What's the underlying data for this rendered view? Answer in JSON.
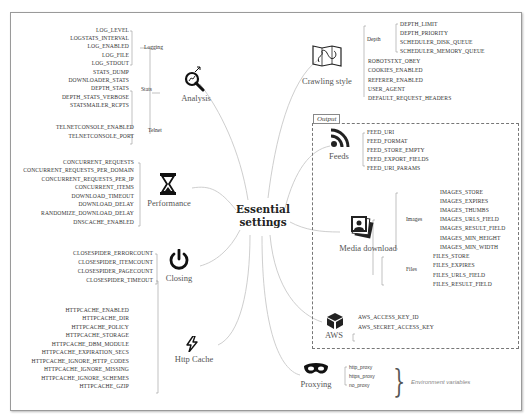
{
  "center": {
    "line1": "Essential",
    "line2": "settings"
  },
  "output_label": "Output",
  "env_label": "Environment variables",
  "analysis": {
    "label": "Analysis",
    "icon": "magnifier-chart-icon",
    "logging": {
      "label": "Logging",
      "items": [
        "LOG_LEVEL",
        "LOGSTATS_INTERVAL",
        "LOG_ENABLED",
        "LOG_FILE",
        "LOG_STDOUT"
      ]
    },
    "stats": {
      "label": "Stats",
      "items": [
        "STATS_DUMP",
        "DOWNLOADER_STATS",
        "DEPTH_STATS",
        "DEPTH_STATS_VERBOSE",
        "STATSMAILER_RCPTS"
      ]
    },
    "telnet": {
      "label": "Telnet",
      "items": [
        "TELNETCONSOLE_ENABLED",
        "TELNETCONSOLE_PORT"
      ]
    }
  },
  "performance": {
    "label": "Performance",
    "icon": "hourglass-icon",
    "items": [
      "CONCURRENT_REQUESTS",
      "CONCURRENT_REQUESTS_PER_DOMAIN",
      "CONCURRENT_REQUESTS_PER_IP",
      "CONCURRENT_ITEMS",
      "DOWNLOAD_TIMEOUT",
      "DOWNLOAD_DELAY",
      "RANDOMIZE_DOWNLOAD_DELAY",
      "DNSCACHE_ENABLED"
    ]
  },
  "closing": {
    "label": "Closing",
    "icon": "power-icon",
    "items": [
      "CLOSESPIDER_ERRORCOUNT",
      "CLOSESPIDER_ITEMCOUNT",
      "CLOSESPIDER_PAGECOUNT",
      "CLOSESPIDER_TIMEOUT"
    ]
  },
  "httpcache": {
    "label": "Http Cache",
    "icon": "lightning-icon",
    "items": [
      "HTTPCACHE_ENABLED",
      "HTTPCACHE_DIR",
      "HTTPCACHE_POLICY",
      "HTTPCACHE_STORAGE",
      "HTTPCACHE_DBM_MODULE",
      "HTTPCACHE_EXPIRATION_SECS",
      "HTTPCACHE_IGNORE_HTTP_CODES",
      "HTTPCACHE_IGNORE_MISSING",
      "HTTPCACHE_IGNORE_SCHEMES",
      "HTTPCACHE_GZIP"
    ]
  },
  "crawling": {
    "label": "Crawling style",
    "icon": "map-icon",
    "depth": {
      "label": "Depth",
      "items": [
        "DEPTH_LIMIT",
        "DEPTH_PRIORITY",
        "SCHEDULER_DISK_QUEUE",
        "SCHEDULER_MEMORY_QUEUE"
      ]
    },
    "items": [
      "ROBOTSTXT_OBEY",
      "COOKIES_ENABLED",
      "REFERER_ENABLED",
      "USER_AGENT",
      "DEFAULT_REQUEST_HEADERS"
    ]
  },
  "feeds": {
    "label": "Feeds",
    "icon": "rss-icon",
    "items": [
      "FEED_URI",
      "FEED_FORMAT",
      "FEED_STORE_EMPTY",
      "FEED_EXPORT_FIELDS",
      "FEED_URI_PARAMS"
    ]
  },
  "media": {
    "label": "Media download",
    "icon": "photos-icon",
    "images": {
      "label": "Images",
      "items": [
        "IMAGES_STORE",
        "IMAGES_EXPIRES",
        "IMAGES_THUMBS",
        "IMAGES_URLS_FIELD",
        "IMAGES_RESULT_FIELD",
        "IMAGES_MIN_HEIGHT",
        "IMAGES_MIN_WIDTH"
      ]
    },
    "files": {
      "label": "Files",
      "items": [
        "FILES_STORE",
        "FILES_EXPIRES",
        "FILES_URLS_FIELD",
        "FILES_RESULT_FIELD"
      ]
    }
  },
  "aws": {
    "label": "AWS",
    "icon": "cube-icon",
    "items": [
      "AWS_ACCESS_KEY_ID",
      "AWS_SECRET_ACCESS_KEY"
    ]
  },
  "proxying": {
    "label": "Proxying",
    "icon": "mask-icon",
    "items": [
      "http_proxy",
      "https_proxy",
      "no_proxy"
    ]
  }
}
